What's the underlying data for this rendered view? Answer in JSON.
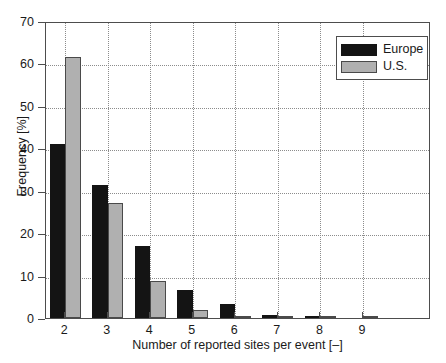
{
  "chart_data": {
    "type": "bar",
    "title": "",
    "xlabel": "Number of reported sites per event [–]",
    "ylabel": "Frequency [%]",
    "categories": [
      "2",
      "3",
      "4",
      "5",
      "6",
      "7",
      "8",
      "9"
    ],
    "series": [
      {
        "name": "Europe",
        "color": "#141414",
        "values": [
          41.0,
          31.3,
          17.0,
          6.5,
          3.2,
          0.8,
          0.15,
          0.0
        ]
      },
      {
        "name": "U.S.",
        "color": "#b0b0b0",
        "values": [
          61.5,
          27.2,
          8.7,
          1.8,
          0.35,
          0.15,
          0.15,
          0.15
        ]
      }
    ],
    "xlim": [
      1.55,
      10.6
    ],
    "ylim": [
      0,
      70
    ],
    "yticks": [
      0,
      10,
      20,
      30,
      40,
      50,
      60,
      70
    ],
    "ytick_labels": [
      "0",
      "10",
      "20",
      "30",
      "40",
      "50",
      "60",
      "70"
    ],
    "xticks": [
      2,
      3,
      4,
      5,
      6,
      7,
      8,
      9
    ],
    "xtick_labels": [
      "2",
      "3",
      "4",
      "5",
      "6",
      "7",
      "8",
      "9"
    ],
    "grid": true,
    "grid_style": "dotted",
    "grid_color": "#8c8c8c",
    "legend": {
      "position": "upper-right",
      "entries": [
        {
          "label": "Europe",
          "swatch": "#141414"
        },
        {
          "label": "U.S.",
          "swatch": "#b0b0b0"
        }
      ]
    },
    "axis_color": "#4d4d4d",
    "background": "#ffffff"
  }
}
